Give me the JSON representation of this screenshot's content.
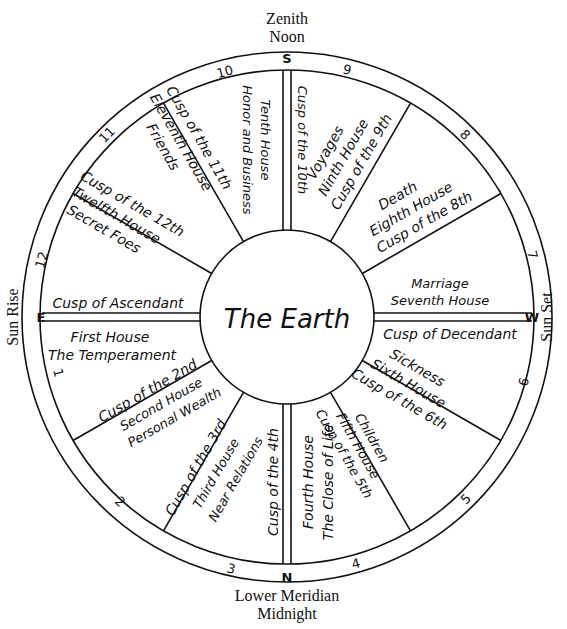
{
  "diagram": {
    "center_label": "The Earth",
    "compass": {
      "top": {
        "letter": "S",
        "label_line1": "Zenith",
        "label_line2": "Noon"
      },
      "bottom": {
        "letter": "N",
        "label_line1": "Lower Meridian",
        "label_line2": "Midnight"
      },
      "left": {
        "letter": "E",
        "label": "Sun Rise"
      },
      "right": {
        "letter": "W",
        "label": "Sun Set"
      }
    },
    "ring_numbers": [
      "1",
      "2",
      "3",
      "4",
      "5",
      "6",
      "7",
      "8",
      "9",
      "10",
      "11",
      "12"
    ],
    "houses": [
      {
        "number": 1,
        "cusp": "Cusp of Ascendant",
        "name": "First House",
        "meaning": "The Temperament"
      },
      {
        "number": 2,
        "cusp": "Cusp of the 2nd",
        "name": "Second House",
        "meaning": "Personal Wealth"
      },
      {
        "number": 3,
        "cusp": "Cusp of the 3rd",
        "name": "Third House",
        "meaning": "Near Relations"
      },
      {
        "number": 4,
        "cusp": "Cusp of the 4th",
        "name": "Fourth House",
        "meaning": "The Close of Life"
      },
      {
        "number": 5,
        "cusp": "Cusp of the 5th",
        "name": "Fifth House",
        "meaning": "Children"
      },
      {
        "number": 6,
        "cusp": "Cusp of the 6th",
        "name": "Sixth House",
        "meaning": "Sickness"
      },
      {
        "number": 7,
        "cusp": "Cusp of Decendant",
        "name": "Seventh House",
        "meaning": "Marriage"
      },
      {
        "number": 8,
        "cusp": "Cusp of the 8th",
        "name": "Eighth House",
        "meaning": "Death"
      },
      {
        "number": 9,
        "cusp": "Cusp of the 9th",
        "name": "Ninth House",
        "meaning": "Voyages"
      },
      {
        "number": 10,
        "cusp": "Cusp of the 10th",
        "name": "Tenth House",
        "meaning": "Honor and Business"
      },
      {
        "number": 11,
        "cusp": "Cusp of the 11th",
        "name": "Eleventh House",
        "meaning": "Friends"
      },
      {
        "number": 12,
        "cusp": "Cusp of the 12th",
        "name": "Twelfth House",
        "meaning": "Secret Foes"
      }
    ]
  }
}
